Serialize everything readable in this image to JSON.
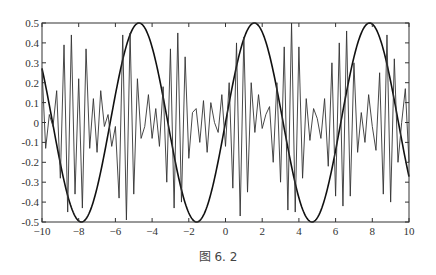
{
  "caption": "图 6. 2",
  "chart_data": {
    "type": "line",
    "title": "",
    "xlabel": "",
    "ylabel": "",
    "xlim": [
      -10,
      10
    ],
    "ylim": [
      -0.5,
      0.5
    ],
    "grid": false,
    "legend": null,
    "x_ticks": [
      -10,
      -8,
      -6,
      -4,
      -2,
      0,
      2,
      4,
      6,
      8,
      10
    ],
    "x_tick_labels": [
      "-10",
      "-8",
      "-6",
      "-4",
      "-2",
      "0",
      "2",
      "4",
      "6",
      "8",
      "10"
    ],
    "y_ticks": [
      -0.5,
      -0.4,
      -0.3,
      -0.2,
      -0.1,
      0,
      0.1,
      0.2,
      0.3,
      0.4,
      0.5
    ],
    "y_tick_labels": [
      "-0.5",
      "-0.4",
      "-0.3",
      "-0.2",
      "-0.1",
      "0",
      "0.1",
      "0.2",
      "0.3",
      "0.4",
      "0.5"
    ],
    "series": [
      {
        "name": "envelope",
        "description": "smooth sinusoid y = 0.5*sin(x)",
        "style": "thick",
        "color": "#111111",
        "x": [
          -10,
          -9,
          -8,
          -7.85,
          -7,
          -6,
          -5,
          -4.71,
          -4,
          -3,
          -2,
          -1.57,
          -1,
          0,
          1,
          1.57,
          2,
          3,
          4,
          4.71,
          5,
          6,
          7,
          7.85,
          8,
          9,
          10
        ],
        "values": [
          0.27,
          -0.21,
          -0.49,
          -0.5,
          -0.33,
          0.14,
          0.48,
          0.5,
          0.38,
          -0.07,
          -0.45,
          -0.5,
          -0.42,
          0,
          0.42,
          0.5,
          0.45,
          0.07,
          -0.38,
          -0.5,
          -0.48,
          -0.14,
          0.33,
          0.5,
          0.49,
          0.21,
          -0.27
        ]
      },
      {
        "name": "oscillation",
        "description": "fast, coarsely sampled oscillation within ±0.5",
        "style": "thin",
        "color": "#333333",
        "x": [
          -10,
          -9.8,
          -9.6,
          -9.4,
          -9.2,
          -9.0,
          -8.8,
          -8.6,
          -8.4,
          -8.2,
          -8.0,
          -7.8,
          -7.6,
          -7.4,
          -7.2,
          -7.0,
          -6.8,
          -6.6,
          -6.4,
          -6.2,
          -6.0,
          -5.8,
          -5.6,
          -5.4,
          -5.2,
          -5.0,
          -4.8,
          -4.6,
          -4.4,
          -4.2,
          -4.0,
          -3.8,
          -3.6,
          -3.4,
          -3.2,
          -3.0,
          -2.8,
          -2.6,
          -2.4,
          -2.2,
          -2.0,
          -1.8,
          -1.6,
          -1.4,
          -1.2,
          -1.0,
          -0.8,
          -0.6,
          -0.4,
          -0.2,
          0.0,
          0.2,
          0.4,
          0.6,
          0.8,
          1.0,
          1.2,
          1.4,
          1.6,
          1.8,
          2.0,
          2.2,
          2.4,
          2.6,
          2.8,
          3.0,
          3.2,
          3.4,
          3.6,
          3.8,
          4.0,
          4.2,
          4.4,
          4.6,
          4.8,
          5.0,
          5.2,
          5.4,
          5.6,
          5.8,
          6.0,
          6.2,
          6.4,
          6.6,
          6.8,
          7.0,
          7.2,
          7.4,
          7.6,
          7.8,
          8.0,
          8.2,
          8.4,
          8.6,
          8.8,
          9.0,
          9.2,
          9.4,
          9.6,
          9.8,
          10.0
        ],
        "values": [
          0.27,
          -0.13,
          0.04,
          -0.02,
          0.16,
          -0.28,
          0.39,
          -0.45,
          0.44,
          -0.36,
          0.22,
          -0.43,
          0.37,
          -0.13,
          0.12,
          -0.15,
          0.16,
          -0.02,
          0.04,
          -0.12,
          -0.02,
          -0.38,
          0.44,
          -0.49,
          0.45,
          -0.36,
          0.22,
          -0.08,
          -0.02,
          0.14,
          -0.08,
          0.07,
          -0.12,
          0.18,
          -0.3,
          0.37,
          -0.43,
          0.45,
          -0.4,
          0.33,
          -0.18,
          0.05,
          0.07,
          -0.1,
          0.11,
          -0.15,
          0.1,
          0.0,
          -0.05,
          0.14,
          -0.12,
          0.2,
          -0.33,
          0.4,
          -0.47,
          0.43,
          -0.35,
          0.2,
          -0.05,
          0.14,
          -0.03,
          0.04,
          0.08,
          -0.2,
          0.2,
          -0.3,
          0.38,
          -0.44,
          0.5,
          -0.45,
          0.38,
          -0.28,
          0.12,
          -0.09,
          0.07,
          0.02,
          -0.08,
          0.12,
          -0.22,
          0.3,
          -0.37,
          0.4,
          -0.42,
          0.46,
          -0.37,
          0.3,
          -0.15,
          0.05,
          -0.1,
          0.14,
          -0.02,
          -0.14,
          0.25,
          -0.36,
          0.44,
          -0.4,
          0.32,
          -0.2,
          0.0,
          0.17,
          -0.2
        ]
      }
    ]
  },
  "colors": {
    "axis": "#333333",
    "background": "#ffffff"
  }
}
